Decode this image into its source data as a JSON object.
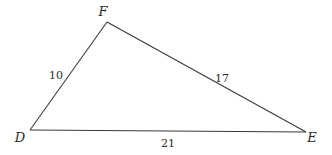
{
  "diagram": {
    "type": "triangle",
    "vertices": {
      "D": {
        "label": "D",
        "x": 30,
        "y": 130
      },
      "F": {
        "label": "F",
        "x": 107,
        "y": 22
      },
      "E": {
        "label": "E",
        "x": 306,
        "y": 132
      }
    },
    "sides": {
      "DF": {
        "label": "10"
      },
      "FE": {
        "label": "17"
      },
      "DE": {
        "label": "21"
      }
    },
    "colors": {
      "stroke": "#3a3a3a",
      "text": "#2a2a2a",
      "background": "#ffffff"
    }
  }
}
